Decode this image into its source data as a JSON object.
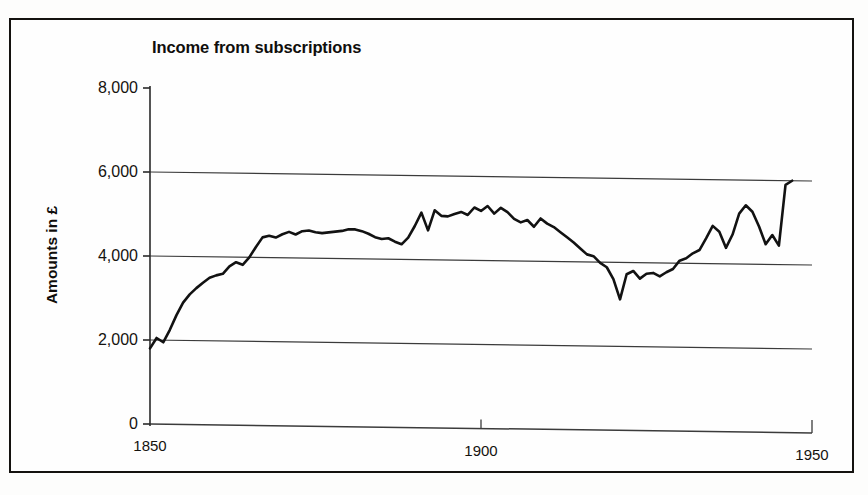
{
  "chart_data": {
    "type": "line",
    "title": "Income from subscriptions",
    "xlabel": "",
    "ylabel": "Amounts in £",
    "xlim": [
      1850,
      1950
    ],
    "ylim": [
      0,
      8000
    ],
    "xticks": [
      1850,
      1900,
      1950
    ],
    "xtick_labels": [
      "1850",
      "1900",
      "1950"
    ],
    "yticks": [
      0,
      2000,
      4000,
      6000,
      8000
    ],
    "ytick_labels": [
      "0",
      "2,000",
      "4,000",
      "6,000",
      "8,000"
    ],
    "grid": "horizontal",
    "legend": "none",
    "line_color": "#121212",
    "series": [
      {
        "name": "Income from subscriptions",
        "x": [
          1850,
          1851,
          1852,
          1853,
          1854,
          1855,
          1856,
          1857,
          1858,
          1859,
          1860,
          1861,
          1862,
          1863,
          1864,
          1865,
          1866,
          1867,
          1868,
          1869,
          1870,
          1871,
          1872,
          1873,
          1874,
          1875,
          1876,
          1877,
          1878,
          1879,
          1880,
          1881,
          1882,
          1883,
          1884,
          1885,
          1886,
          1887,
          1888,
          1889,
          1890,
          1891,
          1892,
          1893,
          1894,
          1895,
          1896,
          1897,
          1898,
          1899,
          1900,
          1901,
          1902,
          1903,
          1904,
          1905,
          1906,
          1907,
          1908,
          1909,
          1910,
          1911,
          1912,
          1913,
          1914,
          1915,
          1916,
          1917,
          1918,
          1919,
          1920,
          1921,
          1922,
          1923,
          1924,
          1925,
          1926,
          1927,
          1928,
          1929,
          1930,
          1931,
          1932,
          1933,
          1934,
          1935,
          1936,
          1937,
          1938,
          1939,
          1940,
          1941,
          1942,
          1943,
          1944,
          1945,
          1946,
          1947
        ],
        "values": [
          1800,
          2050,
          1950,
          2250,
          2600,
          2900,
          3100,
          3250,
          3380,
          3500,
          3560,
          3600,
          3780,
          3880,
          3820,
          4000,
          4250,
          4480,
          4520,
          4480,
          4560,
          4620,
          4560,
          4640,
          4660,
          4620,
          4600,
          4620,
          4640,
          4660,
          4700,
          4700,
          4660,
          4600,
          4520,
          4480,
          4500,
          4420,
          4360,
          4520,
          4800,
          5120,
          4700,
          5180,
          5050,
          5040,
          5100,
          5150,
          5080,
          5260,
          5180,
          5300,
          5120,
          5260,
          5160,
          5000,
          4920,
          4980,
          4820,
          5020,
          4900,
          4820,
          4700,
          4580,
          4460,
          4320,
          4180,
          4140,
          3980,
          3880,
          3600,
          3120,
          3720,
          3800,
          3620,
          3740,
          3760,
          3680,
          3780,
          3860,
          4060,
          4120,
          4240,
          4320,
          4600,
          4900,
          4760,
          4380,
          4700,
          5200,
          5400,
          5250,
          4900,
          4480,
          4700,
          4450,
          5900,
          6000
        ]
      }
    ]
  },
  "axes": {
    "y_title": "Amounts in £",
    "y_labels": [
      "8,000",
      "6,000",
      "4,000",
      "2,000",
      "0"
    ],
    "x_labels": [
      "1850",
      "1900",
      "1950"
    ]
  }
}
